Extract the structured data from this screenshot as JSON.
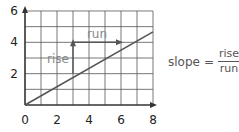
{
  "chart_data": {
    "type": "line",
    "title": "",
    "xlabel": "",
    "ylabel": "",
    "x_ticks": [
      0,
      2,
      4,
      6,
      8
    ],
    "y_ticks": [
      2,
      4,
      6
    ],
    "xlim": [
      0,
      8
    ],
    "ylim": [
      0,
      6
    ],
    "grid": true,
    "grid_step": 1,
    "series": [
      {
        "name": "line",
        "x": [
          0,
          8
        ],
        "y": [
          0,
          4.67
        ]
      }
    ],
    "annotations": [
      {
        "label": "rise",
        "from": [
          3,
          2
        ],
        "to": [
          3,
          4
        ],
        "type": "vertical-arrow"
      },
      {
        "label": "run",
        "from": [
          3,
          4
        ],
        "to": [
          6,
          4
        ],
        "type": "horizontal-arrow"
      }
    ]
  },
  "labels": {
    "x_ticks": [
      "0",
      "2",
      "4",
      "6",
      "8"
    ],
    "y_ticks": [
      "2",
      "4",
      "6"
    ],
    "rise": "rise",
    "run": "run"
  },
  "formula": {
    "lhs": "slope",
    "equals": "=",
    "numerator": "rise",
    "denominator": "run"
  },
  "colors": {
    "grid": "#555555",
    "axis": "#333333",
    "line": "#555555",
    "text": "#555555",
    "annotation_text": "#888888"
  }
}
